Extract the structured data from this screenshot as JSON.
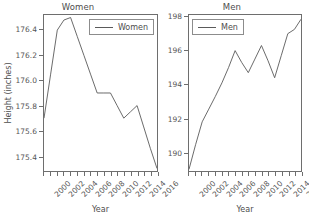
{
  "chart_data": [
    {
      "type": "line",
      "title": "Women",
      "xlabel": "Year",
      "ylabel": "Height (inches)",
      "legend": [
        "Women"
      ],
      "legend_position": "top-right",
      "grid": false,
      "xlim": [
        2000,
        2017
      ],
      "ylim": [
        175.28,
        176.52
      ],
      "xticks_labeled": [
        "2000",
        "2002",
        "2004",
        "2006",
        "2008",
        "2010",
        "2012",
        "2014",
        "2016"
      ],
      "xtick_values_labeled": [
        2000,
        2002,
        2004,
        2006,
        2008,
        2010,
        2012,
        2014,
        2016
      ],
      "yticks": [
        "175.4",
        "175.6",
        "175.8",
        "176.0",
        "176.2",
        "176.4"
      ],
      "ytick_values": [
        175.4,
        175.6,
        175.8,
        176.0,
        176.2,
        176.4
      ],
      "series": [
        {
          "name": "Women",
          "x": [
            2000,
            2001,
            2002,
            2003,
            2004,
            2005,
            2006,
            2007,
            2008,
            2009,
            2010,
            2011,
            2012,
            2013,
            2014,
            2015,
            2016,
            2017
          ],
          "values": [
            175.7,
            176.05,
            176.4,
            176.48,
            176.5,
            176.35,
            176.2,
            176.05,
            175.9,
            175.9,
            175.9,
            175.8,
            175.7,
            175.75,
            175.8,
            175.63,
            175.46,
            175.3
          ]
        }
      ]
    },
    {
      "type": "line",
      "title": "Men",
      "xlabel": "Year",
      "ylabel": "",
      "legend": [
        "Men"
      ],
      "legend_position": "top-left",
      "grid": false,
      "xlim": [
        2000,
        2017
      ],
      "ylim": [
        188.9,
        198.1
      ],
      "xticks_labeled": [
        "2000",
        "2002",
        "2004",
        "2006",
        "2008",
        "2010",
        "2012",
        "2014",
        "2016"
      ],
      "xtick_values_labeled": [
        2000,
        2002,
        2004,
        2006,
        2008,
        2010,
        2012,
        2014,
        2016
      ],
      "yticks": [
        "190",
        "192",
        "194",
        "196",
        "198"
      ],
      "ytick_values": [
        190,
        192,
        194,
        196,
        198
      ],
      "series": [
        {
          "name": "Men",
          "x": [
            2000,
            2001,
            2002,
            2003,
            2004,
            2005,
            2006,
            2007,
            2008,
            2009,
            2010,
            2011,
            2012,
            2013,
            2014,
            2015,
            2016,
            2017
          ],
          "values": [
            189.0,
            190.45,
            191.8,
            192.55,
            193.3,
            194.1,
            195.0,
            196.0,
            195.3,
            194.7,
            195.5,
            196.3,
            195.4,
            194.4,
            195.7,
            197.0,
            197.25,
            197.85
          ]
        }
      ]
    }
  ],
  "panels": {
    "women": {
      "title": "Women",
      "legend_label": "Women",
      "axis_title_x": "Year",
      "axis_title_y": "Height (inches)"
    },
    "men": {
      "title": "Men",
      "legend_label": "Men",
      "axis_title_x": "Year",
      "axis_title_y": ""
    }
  },
  "colors": {
    "line": "#5a5a5a",
    "axis": "#6e6e6e",
    "text": "#4d4d4d",
    "background": "#ffffff"
  }
}
